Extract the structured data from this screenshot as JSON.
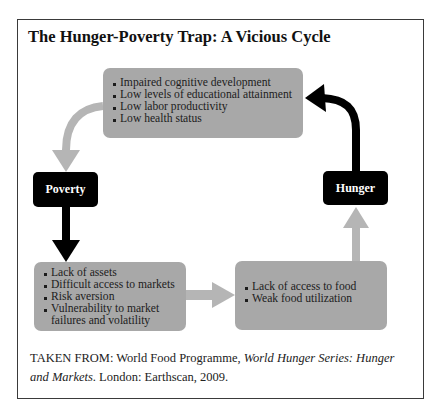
{
  "title": "The Hunger-Poverty Trap: A Vicious Cycle",
  "nodes": {
    "poverty": "Poverty",
    "hunger": "Hunger"
  },
  "boxes": {
    "top": {
      "items": [
        "Impaired cognitive development",
        "Low levels of educational attainment",
        "Low labor productivity",
        "Low health status"
      ]
    },
    "bottom_left": {
      "items": [
        "Lack of assets",
        "Difficult access to markets",
        "Risk aversion",
        "Vulnerability to market failures and volatility"
      ]
    },
    "bottom_right": {
      "items": [
        "Lack of access to food",
        "Weak food utilization"
      ]
    }
  },
  "caption": {
    "prefix": "TAKEN FROM: World Food Programme, ",
    "italic_title": "World Hunger Series: Hunger and Markets",
    "suffix": ". London: Earthscan, 2009."
  },
  "colors": {
    "box_fill": "#a8a8a8",
    "gray_arrow": "#b5b5b5",
    "black": "#000000"
  }
}
